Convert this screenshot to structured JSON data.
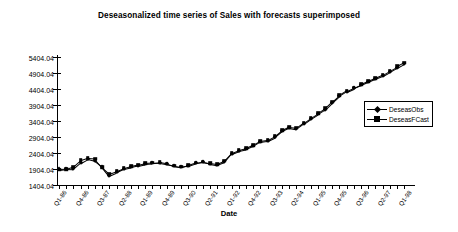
{
  "chart_data": {
    "type": "line",
    "title": "Deseasonalized time series of Sales with forecasts superimposed",
    "xlabel": "Date",
    "ylabel": "",
    "ylim": [
      1404.04,
      5404.04
    ],
    "yticks": [
      "1404.04",
      "1904.04",
      "2404.04",
      "2904.04",
      "3404.04",
      "3904.04",
      "4404.04",
      "4904.04",
      "5404.04"
    ],
    "ytick_values": [
      1404.04,
      1904.04,
      2404.04,
      2904.04,
      3404.04,
      3904.04,
      4404.04,
      4904.04,
      5404.04
    ],
    "grid": false,
    "legend_position": "right",
    "xtick_labels": [
      "Q1-86",
      "Q4-86",
      "Q3-87",
      "Q2-88",
      "Q1-89",
      "Q4-89",
      "Q3-90",
      "Q2-91",
      "Q1-92",
      "Q4-92",
      "Q3-93",
      "Q2-94",
      "Q1-95",
      "Q4-95",
      "Q3-96",
      "Q2-97",
      "Q1-98"
    ],
    "x": [
      "Q1-86",
      "Q2-86",
      "Q3-86",
      "Q4-86",
      "Q1-87",
      "Q2-87",
      "Q3-87",
      "Q4-87",
      "Q1-88",
      "Q2-88",
      "Q3-88",
      "Q4-88",
      "Q1-89",
      "Q2-89",
      "Q3-89",
      "Q4-89",
      "Q1-90",
      "Q2-90",
      "Q3-90",
      "Q4-90",
      "Q1-91",
      "Q2-91",
      "Q3-91",
      "Q4-91",
      "Q1-92",
      "Q2-92",
      "Q3-92",
      "Q4-92",
      "Q1-93",
      "Q2-93",
      "Q3-93",
      "Q4-93",
      "Q1-94",
      "Q2-94",
      "Q3-94",
      "Q4-94",
      "Q1-95",
      "Q2-95",
      "Q3-95",
      "Q4-95",
      "Q1-96",
      "Q2-96",
      "Q3-96",
      "Q4-96",
      "Q1-97",
      "Q2-97",
      "Q3-97",
      "Q4-97",
      "Q1-98"
    ],
    "series": [
      {
        "name": "DeseasObs",
        "marker": "diamond",
        "values": [
          1890,
          1900,
          1895,
          2090,
          2210,
          2150,
          1980,
          1700,
          1800,
          1910,
          1960,
          2010,
          2060,
          2080,
          2100,
          2060,
          2000,
          1960,
          2010,
          2080,
          2120,
          2070,
          2030,
          2120,
          2380,
          2470,
          2520,
          2620,
          2760,
          2790,
          2900,
          3090,
          3200,
          3160,
          3320,
          3480,
          3620,
          3760,
          3980,
          4180,
          4320,
          4420,
          4520,
          4620,
          4720,
          4810,
          4930,
          5060,
          5180
        ]
      },
      {
        "name": "DeseasFCast",
        "marker": "square",
        "values": [
          1880,
          1905,
          1980,
          2180,
          2250,
          2230,
          1960,
          1760,
          1840,
          1930,
          1985,
          2035,
          2090,
          2105,
          2110,
          2070,
          2010,
          1980,
          2030,
          2100,
          2135,
          2090,
          2060,
          2160,
          2400,
          2490,
          2545,
          2650,
          2780,
          2810,
          2930,
          3110,
          3215,
          3190,
          3350,
          3510,
          3650,
          3800,
          4010,
          4210,
          4350,
          4450,
          4550,
          4650,
          4750,
          4850,
          4980,
          5110,
          5230
        ]
      }
    ]
  },
  "legend": {
    "items": [
      {
        "label": "DeseasObs"
      },
      {
        "label": "DeseasFCast"
      }
    ]
  }
}
